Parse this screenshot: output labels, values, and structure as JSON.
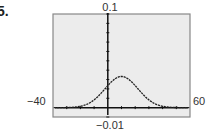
{
  "problem_number": "5.",
  "chart_data": {
    "type": "line",
    "title": "",
    "xlabel": "",
    "ylabel": "",
    "xlim": [
      -40,
      60
    ],
    "ylim": [
      -0.01,
      0.1
    ],
    "x_tick_step": 10,
    "y_tick_step": 0.01,
    "grid": false,
    "window_labels": {
      "xmin": "-40",
      "xmax": "60",
      "ymin": "-0.01",
      "ymax": "0.1"
    },
    "series": [
      {
        "name": "normal density",
        "function": "y = (1/(12*sqrt(2*pi))) * exp(-(x-10)^2/(2*12^2))",
        "mean": 10,
        "sd": 12,
        "x": [
          -40,
          -30,
          -20,
          -10,
          0,
          5,
          10,
          15,
          20,
          30,
          40,
          50,
          60
        ],
        "values": [
          0.0,
          0.0001,
          0.0015,
          0.0083,
          0.0234,
          0.0305,
          0.0332,
          0.0305,
          0.0234,
          0.0083,
          0.0015,
          0.0001,
          0.0
        ]
      }
    ],
    "colors": {
      "background": "#ececec",
      "frame": "#888888",
      "curve": "#222222",
      "axes": "#111111"
    }
  }
}
